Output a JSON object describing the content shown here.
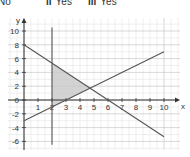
{
  "answers": [
    {
      "num": "",
      "text": "No"
    },
    {
      "num": "ii",
      "text": "Yes"
    },
    {
      "num": "iii",
      "text": "Yes"
    }
  ],
  "chart_data": {
    "type": "line",
    "title": "",
    "xlabel": "x",
    "ylabel": "y",
    "xlim": [
      -1,
      11
    ],
    "ylim": [
      -7,
      11
    ],
    "grid": true,
    "x_ticks": [
      1,
      2,
      3,
      4,
      5,
      6,
      7,
      8,
      9,
      10
    ],
    "y_ticks": [
      -6,
      -4,
      -2,
      0,
      2,
      4,
      6,
      8,
      10
    ],
    "series": [
      {
        "name": "line 1 (y = 8 - 4x/3)",
        "x": [
          0,
          10
        ],
        "y": [
          8,
          -5.33
        ]
      },
      {
        "name": "line 2 (y = x - 3)",
        "x": [
          0,
          10
        ],
        "y": [
          -3,
          7
        ]
      },
      {
        "name": "vertical line x = 2",
        "x": [
          2,
          2
        ],
        "y": [
          -6.5,
          10.5
        ]
      }
    ],
    "shaded_region": {
      "description": "triangle bounded by x = 2, y = 8 - 4x/3 and y = x - 3",
      "vertices": [
        [
          2,
          5.33
        ],
        [
          2,
          -1
        ],
        [
          4.71,
          1.71
        ]
      ],
      "color": "#c8c8c8"
    },
    "colors": {
      "grid_minor": "#e4e4e4",
      "grid_major": "#bdbdbd",
      "lines": "#555555"
    }
  }
}
